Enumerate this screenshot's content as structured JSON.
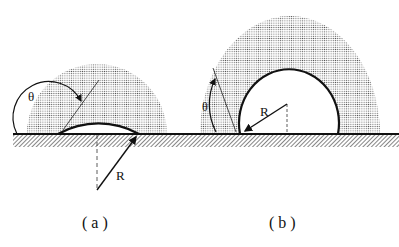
{
  "figure": {
    "panels": [
      {
        "id": "a",
        "caption": "( a )",
        "angle_label": "θ",
        "radius_label": "R"
      },
      {
        "id": "b",
        "caption": "( b )",
        "angle_label": "θ",
        "radius_label": "R"
      }
    ]
  }
}
